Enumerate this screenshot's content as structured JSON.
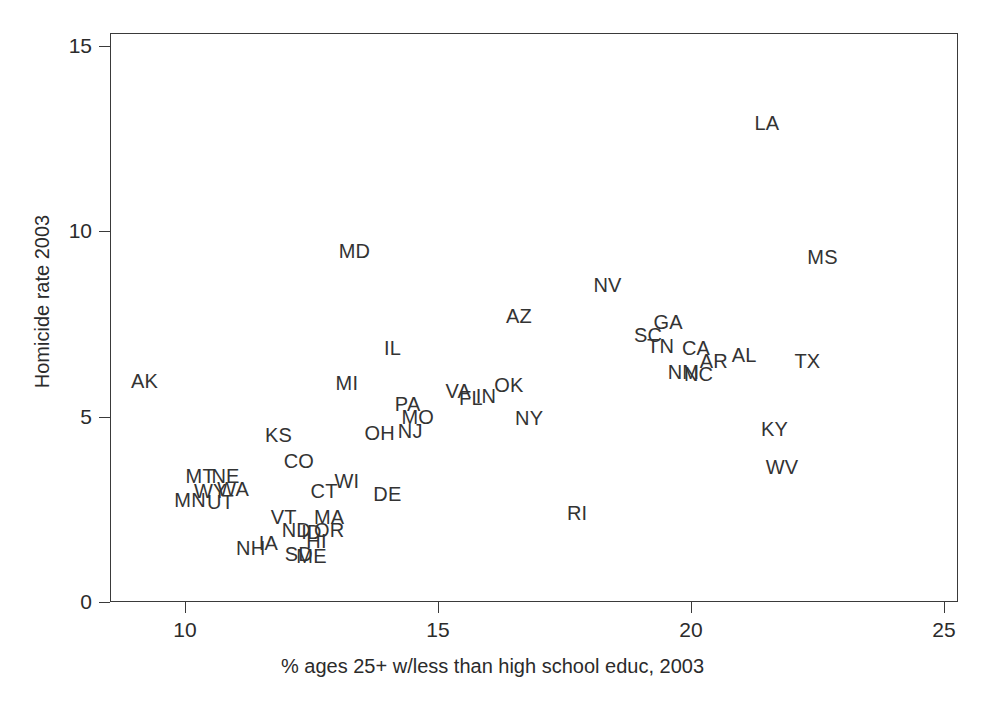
{
  "chart_data": {
    "type": "scatter",
    "title": "",
    "xlabel": "% ages 25+ w/less than high school educ, 2003",
    "ylabel": "Homicide rate 2003",
    "xlim": [
      8.6,
      25.4
    ],
    "ylim": [
      -0.4,
      15.6
    ],
    "xticks": [
      10,
      15,
      20,
      25
    ],
    "xtick_labels": [
      "10",
      "15",
      "20",
      "25"
    ],
    "yticks": [
      0,
      5,
      10,
      15
    ],
    "ytick_labels": [
      "0",
      "5",
      "10",
      "15"
    ],
    "grid": false,
    "legend": "none",
    "marker": "text-label",
    "points": [
      {
        "label": "AK",
        "x": 9.2,
        "y": 5.95
      },
      {
        "label": "MN",
        "x": 10.1,
        "y": 2.75
      },
      {
        "label": "MT",
        "x": 10.3,
        "y": 3.4
      },
      {
        "label": "WY",
        "x": 10.5,
        "y": 3.0
      },
      {
        "label": "UT",
        "x": 10.7,
        "y": 2.7
      },
      {
        "label": "NE",
        "x": 10.8,
        "y": 3.4
      },
      {
        "label": "WA",
        "x": 10.95,
        "y": 3.05
      },
      {
        "label": "NH",
        "x": 11.3,
        "y": 1.45
      },
      {
        "label": "IA",
        "x": 11.65,
        "y": 1.6
      },
      {
        "label": "VT",
        "x": 11.95,
        "y": 2.3
      },
      {
        "label": "KS",
        "x": 11.85,
        "y": 4.5
      },
      {
        "label": "CO",
        "x": 12.25,
        "y": 3.8
      },
      {
        "label": "ND",
        "x": 12.2,
        "y": 1.95
      },
      {
        "label": "SD",
        "x": 12.25,
        "y": 1.3
      },
      {
        "label": "ID",
        "x": 12.5,
        "y": 1.9
      },
      {
        "label": "ME",
        "x": 12.5,
        "y": 1.25
      },
      {
        "label": "HI",
        "x": 12.6,
        "y": 1.65
      },
      {
        "label": "CT",
        "x": 12.75,
        "y": 3.0
      },
      {
        "label": "MA",
        "x": 12.85,
        "y": 2.3
      },
      {
        "label": "OR",
        "x": 12.85,
        "y": 1.95
      },
      {
        "label": "WI",
        "x": 13.2,
        "y": 3.25
      },
      {
        "label": "MI",
        "x": 13.2,
        "y": 5.9
      },
      {
        "label": "MD",
        "x": 13.35,
        "y": 9.45
      },
      {
        "label": "DE",
        "x": 14.0,
        "y": 2.9
      },
      {
        "label": "OH",
        "x": 13.85,
        "y": 4.55
      },
      {
        "label": "PA",
        "x": 14.4,
        "y": 5.35
      },
      {
        "label": "IL",
        "x": 14.1,
        "y": 6.85
      },
      {
        "label": "NJ",
        "x": 14.45,
        "y": 4.6
      },
      {
        "label": "MO",
        "x": 14.6,
        "y": 5.0
      },
      {
        "label": "VA",
        "x": 15.4,
        "y": 5.7
      },
      {
        "label": "FL",
        "x": 15.65,
        "y": 5.5
      },
      {
        "label": "IN",
        "x": 15.95,
        "y": 5.55
      },
      {
        "label": "OK",
        "x": 16.4,
        "y": 5.85
      },
      {
        "label": "AZ",
        "x": 16.6,
        "y": 7.7
      },
      {
        "label": "NY",
        "x": 16.8,
        "y": 4.95
      },
      {
        "label": "RI",
        "x": 17.75,
        "y": 2.4
      },
      {
        "label": "NV",
        "x": 18.35,
        "y": 8.55
      },
      {
        "label": "LA",
        "x": 21.5,
        "y": 12.9
      },
      {
        "label": "SC",
        "x": 19.15,
        "y": 7.2
      },
      {
        "label": "TN",
        "x": 19.4,
        "y": 6.9
      },
      {
        "label": "GA",
        "x": 19.55,
        "y": 7.55
      },
      {
        "label": "NM",
        "x": 19.85,
        "y": 6.2
      },
      {
        "label": "CA",
        "x": 20.1,
        "y": 6.85
      },
      {
        "label": "NC",
        "x": 20.15,
        "y": 6.15
      },
      {
        "label": "AR",
        "x": 20.45,
        "y": 6.5
      },
      {
        "label": "AL",
        "x": 21.05,
        "y": 6.65
      },
      {
        "label": "KY",
        "x": 21.65,
        "y": 4.65
      },
      {
        "label": "WV",
        "x": 21.8,
        "y": 3.65
      },
      {
        "label": "TX",
        "x": 22.3,
        "y": 6.5
      },
      {
        "label": "MS",
        "x": 22.6,
        "y": 9.3
      }
    ]
  },
  "axes": {
    "x_title": "% ages 25+ w/less than high school educ, 2003",
    "y_title": "Homicide rate 2003",
    "x_tick_labels": [
      "10",
      "15",
      "20",
      "25"
    ],
    "y_tick_labels": [
      "0",
      "5",
      "10",
      "15"
    ]
  },
  "colors": {
    "background": "#ffffff",
    "axis": "#3a3a3a",
    "label_text": "#333333"
  }
}
